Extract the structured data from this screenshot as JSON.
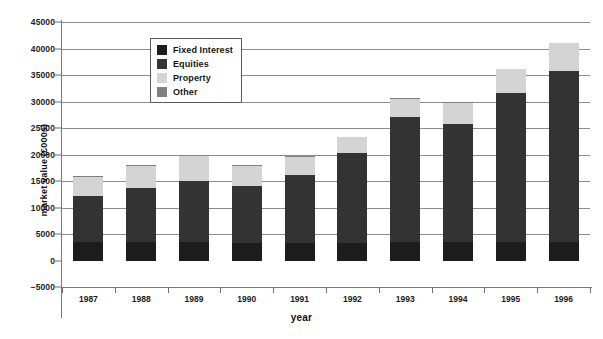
{
  "chart_data": {
    "type": "bar",
    "stacked": true,
    "title": "",
    "xlabel": "year",
    "ylabel": "market value (£000s)",
    "categories": [
      "1987",
      "1988",
      "1989",
      "1990",
      "1991",
      "1992",
      "1993",
      "1994",
      "1995",
      "1996"
    ],
    "series": [
      {
        "name": "Fixed Interest",
        "color": "#1c1c1c",
        "values": [
          3400,
          3400,
          3400,
          3300,
          3300,
          3300,
          3400,
          3400,
          3500,
          3500
        ]
      },
      {
        "name": "Equities",
        "color": "#333333",
        "values": [
          8800,
          10200,
          11600,
          10700,
          12800,
          16900,
          23600,
          22400,
          28200,
          32300
        ]
      },
      {
        "name": "Property",
        "color": "#d4d4d4",
        "values": [
          3500,
          4200,
          4900,
          3900,
          3500,
          3200,
          3600,
          4000,
          4500,
          5200
        ]
      },
      {
        "name": "Other",
        "color": "#808080",
        "values": [
          300,
          300,
          100,
          100,
          100,
          0,
          100,
          100,
          0,
          0
        ]
      }
    ],
    "totals": [
      16000,
      18100,
      20000,
      18000,
      19700,
      23400,
      30700,
      29900,
      36200,
      41000
    ],
    "cumulative_tops": {
      "fixed_interest": [
        3400,
        3400,
        3400,
        3300,
        3300,
        3300,
        3400,
        3400,
        3500,
        3500
      ],
      "equities": [
        12200,
        13600,
        15000,
        14000,
        16100,
        20200,
        27000,
        25800,
        31700,
        35800
      ],
      "property": [
        15700,
        17800,
        19900,
        17900,
        19600,
        23400,
        30600,
        29800,
        36200,
        41000
      ],
      "other": [
        16000,
        18100,
        20000,
        18000,
        19700,
        23400,
        30700,
        29900,
        36200,
        41000
      ]
    },
    "ylim": [
      -5000,
      45000
    ],
    "ytick_step": 5000,
    "yticks": [
      45000,
      40000,
      35000,
      30000,
      25000,
      20000,
      15000,
      10000,
      5000,
      0,
      -5000
    ],
    "ytick_labels": [
      "45000",
      "40000",
      "35000",
      "30000",
      "25000",
      "20000",
      "15000",
      "10000",
      "5000",
      "0",
      "−5000"
    ],
    "grid": true,
    "grid_values": [
      45000,
      40000,
      35000,
      30000,
      25000,
      20000,
      15000,
      10000,
      5000
    ],
    "legend_position": "inside-top-left",
    "legend_entries": [
      {
        "label": "Fixed Interest",
        "color": "#1c1c1c"
      },
      {
        "label": "Equities",
        "color": "#333333"
      },
      {
        "label": "Property",
        "color": "#d4d4d4"
      },
      {
        "label": "Other",
        "color": "#808080"
      }
    ]
  }
}
